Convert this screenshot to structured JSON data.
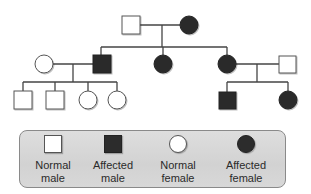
{
  "diagram": {
    "type": "pedigree",
    "colors": {
      "affected_fill": "#2c2c2c",
      "normal_fill": "#ffffff",
      "line": "#444444",
      "legend_bg": "#d6d6d6",
      "legend_border": "#8a8a8a"
    },
    "generations": [
      {
        "id": "I",
        "individuals": [
          {
            "id": "I-1",
            "sex": "male",
            "affected": false
          },
          {
            "id": "I-2",
            "sex": "female",
            "affected": true
          }
        ]
      },
      {
        "id": "II",
        "individuals": [
          {
            "id": "II-spouse-1",
            "sex": "female",
            "affected": false,
            "married_in": true
          },
          {
            "id": "II-1",
            "sex": "male",
            "affected": true
          },
          {
            "id": "II-2",
            "sex": "female",
            "affected": true
          },
          {
            "id": "II-3",
            "sex": "female",
            "affected": true
          },
          {
            "id": "II-spouse-2",
            "sex": "male",
            "affected": false,
            "married_in": true
          }
        ]
      },
      {
        "id": "III",
        "individuals": [
          {
            "id": "III-1",
            "sex": "male",
            "affected": false,
            "parents": "II-1 x II-spouse-1"
          },
          {
            "id": "III-2",
            "sex": "male",
            "affected": false,
            "parents": "II-1 x II-spouse-1"
          },
          {
            "id": "III-3",
            "sex": "female",
            "affected": false,
            "parents": "II-1 x II-spouse-1"
          },
          {
            "id": "III-4",
            "sex": "female",
            "affected": false,
            "parents": "II-1 x II-spouse-1"
          },
          {
            "id": "III-5",
            "sex": "male",
            "affected": true,
            "parents": "II-3 x II-spouse-2"
          },
          {
            "id": "III-6",
            "sex": "female",
            "affected": true,
            "parents": "II-3 x II-spouse-2"
          }
        ]
      }
    ]
  },
  "legend": {
    "items": [
      {
        "key": "normal-male",
        "line1": "Normal",
        "line2": "male"
      },
      {
        "key": "affected-male",
        "line1": "Affected",
        "line2": "male"
      },
      {
        "key": "normal-female",
        "line1": "Normal",
        "line2": "female"
      },
      {
        "key": "affected-female",
        "line1": "Affected",
        "line2": "female"
      }
    ]
  }
}
